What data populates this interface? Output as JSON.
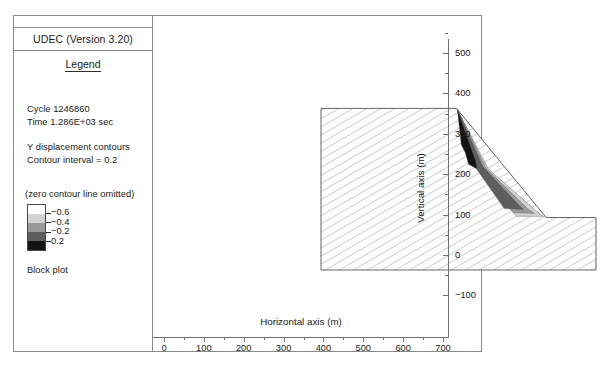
{
  "window": {
    "title": "UDEC (Version 3.20)"
  },
  "legend": {
    "heading": "Legend",
    "cycle": "Cycle 1246860",
    "time": "Time  1.286E+03 sec",
    "quantity": "Y displacement contours",
    "interval": "Contour interval = 0.2",
    "zero_note": "(zero contour line omitted)",
    "plot_type": "Block plot",
    "swatch_labels": [
      "−0.6",
      "−0.4",
      "−0.2",
      "0.2"
    ],
    "swatch_colors": [
      "#ffffff",
      "#d2d2d2",
      "#9a9a9a",
      "#5e5e5e",
      "#141414"
    ]
  },
  "chart_data": {
    "type": "area",
    "xlabel": "Horizontal axis (m)",
    "ylabel": "Vertical axis (m)",
    "xlim": [
      0,
      700
    ],
    "ylim": [
      -100,
      560
    ],
    "xticks": [
      0,
      100,
      200,
      300,
      400,
      500,
      600,
      700
    ],
    "xticklabels": [
      "0",
      "100",
      "200",
      "300",
      "400",
      "500",
      "600",
      "700"
    ],
    "xminor_step": 50,
    "yticks": [
      -100,
      0,
      100,
      200,
      300,
      400,
      500
    ],
    "yticklabels": [
      "−100",
      "0",
      "100",
      "200",
      "300",
      "400",
      "500"
    ],
    "yminor_step": 50,
    "grid": false,
    "legend_position": "left-panel",
    "contour_interval": 0.2,
    "contour_levels": [
      -0.6,
      -0.4,
      -0.2,
      0.2
    ],
    "block_outline_m": [
      [
        10,
        0
      ],
      [
        10,
        400
      ],
      [
        350,
        400
      ],
      [
        575,
        130
      ],
      [
        700,
        130
      ],
      [
        700,
        0
      ]
    ],
    "contour_bands_m": [
      {
        "level": "-0.6",
        "color": "#d2d2d2",
        "polygon": [
          [
            352,
            398
          ],
          [
            430,
            250
          ],
          [
            548,
            148
          ],
          [
            568,
            133
          ],
          [
            500,
            133
          ],
          [
            410,
            250
          ]
        ]
      },
      {
        "level": "-0.4",
        "color": "#9a9a9a",
        "polygon": [
          [
            352,
            398
          ],
          [
            424,
            252
          ],
          [
            528,
            152
          ],
          [
            545,
            140
          ],
          [
            492,
            142
          ],
          [
            402,
            255
          ]
        ]
      },
      {
        "level": "-0.2",
        "color": "#5e5e5e",
        "polygon": [
          [
            352,
            398
          ],
          [
            416,
            256
          ],
          [
            505,
            162
          ],
          [
            518,
            150
          ],
          [
            470,
            152
          ],
          [
            392,
            262
          ]
        ]
      },
      {
        "level": "0.2",
        "color": "#141414",
        "polygon": [
          [
            352,
            398
          ],
          [
            398,
            270
          ],
          [
            402,
            250
          ],
          [
            380,
            262
          ],
          [
            372,
            290
          ],
          [
            362,
            310
          ]
        ]
      }
    ],
    "hatch": {
      "angle_deg": 60,
      "spacing_px": 7,
      "color": "#8a8a8a"
    }
  }
}
